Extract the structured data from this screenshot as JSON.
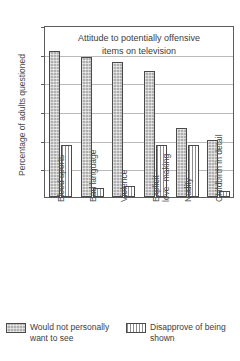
{
  "chart_data": {
    "type": "bar",
    "title": "Attitude to potentially offensive\nitems on television",
    "title_line1": "Attitude to potentially offensive",
    "title_line2": "items on television",
    "xlabel": "",
    "ylabel": "Percentage of adults questioned",
    "ylim": [
      0,
      60
    ],
    "grid": true,
    "legend_position": "bottom",
    "ytick_labels": [
      "60%",
      "50%",
      "40%",
      "30%",
      "20%",
      "10%"
    ],
    "ytick_values": [
      60,
      50,
      40,
      30,
      20,
      10
    ],
    "categories": [
      "Blood sports",
      "Bad language",
      "Violence",
      "Explicit\nlove- making",
      "Nudity",
      "Childbirth in detail"
    ],
    "series": [
      {
        "name": "Would not personally want to see",
        "fill": "solid-stipple",
        "color": "#b0b0b0",
        "values": [
          51,
          49,
          47,
          44,
          24,
          20
        ]
      },
      {
        "name": "Disapprove of being shown",
        "fill": "vertical-hatch",
        "color": "#8e8e8e",
        "values": [
          18,
          3,
          4,
          18,
          18,
          2
        ]
      }
    ]
  },
  "legend": {
    "entries": [
      {
        "label": "Would not personally\nwant to see"
      },
      {
        "label": "Disapprove of being\nshown"
      }
    ]
  },
  "axis": {
    "y_title": "Percentage of adults questioned"
  }
}
